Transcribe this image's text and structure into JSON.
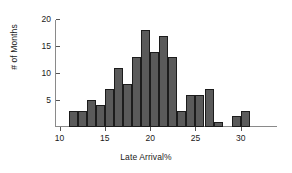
{
  "chart_data": {
    "type": "bar",
    "title": "",
    "subtitle": "",
    "xlabel": "Late Arrival%",
    "ylabel": "# of Months",
    "categories": [
      11,
      12,
      13,
      14,
      15,
      16,
      17,
      18,
      19,
      20,
      21,
      22,
      23,
      24,
      25,
      26,
      27,
      29,
      30
    ],
    "values": [
      3,
      3,
      5,
      4,
      7,
      11,
      8,
      13,
      18,
      14,
      17,
      13,
      3,
      6,
      6,
      7,
      1,
      2,
      3
    ],
    "bin_width": 1,
    "xlim": [
      9.5,
      34
    ],
    "ylim": [
      0,
      21
    ],
    "xticks": [
      10,
      15,
      20,
      25,
      30
    ],
    "xtick_labels": [
      "10",
      "15",
      "20",
      "25",
      "30"
    ],
    "yticks": [
      5,
      10,
      15,
      20
    ],
    "ytick_labels": [
      "5",
      "10",
      "15",
      "20"
    ],
    "grid": false,
    "legend": false,
    "legend_position": "none",
    "bar_fill_color": "#5a5a5a",
    "bar_edge_color": "#1c1c1c",
    "axis_color": "#8a8a8a",
    "background_color": "#ffffff"
  }
}
